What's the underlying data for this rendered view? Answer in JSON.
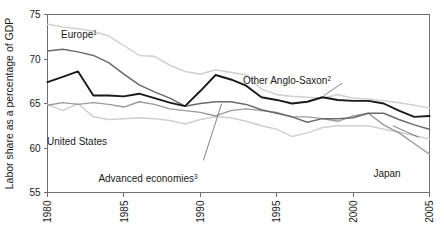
{
  "chart_data": {
    "type": "line",
    "title": "",
    "subtitle": "",
    "xlabel": "",
    "ylabel": "Labor share as a percentage of GDP",
    "xlim": [
      1980,
      2005
    ],
    "ylim": [
      55,
      75
    ],
    "xticks": [
      "1980",
      "1985",
      "1990",
      "1995",
      "2000",
      "2005"
    ],
    "xtick_values": [
      1980,
      1985,
      1990,
      1995,
      2000,
      2005
    ],
    "yticks": [
      "55",
      "60",
      "65",
      "70",
      "75"
    ],
    "ytick_values": [
      55,
      60,
      65,
      70,
      75
    ],
    "grid": false,
    "legend_position": "inline-annotations",
    "x": [
      1980,
      1981,
      1982,
      1983,
      1984,
      1985,
      1986,
      1987,
      1988,
      1989,
      1990,
      1991,
      1992,
      1993,
      1994,
      1995,
      1996,
      1997,
      1998,
      1999,
      2000,
      2001,
      2002,
      2003,
      2004,
      2005
    ],
    "series": [
      {
        "name": "Europe",
        "footnote": "1",
        "color": "#d2d2d2",
        "width": 1.6,
        "values": [
          73.9,
          73.6,
          73.4,
          73.1,
          72.6,
          71.5,
          70.4,
          70.3,
          69.3,
          68.6,
          68.3,
          68.8,
          68.5,
          68.2,
          66.6,
          66.0,
          65.8,
          65.7,
          65.6,
          66.0,
          65.6,
          65.5,
          65.3,
          65.1,
          64.8,
          64.5
        ]
      },
      {
        "name": "Advanced economies",
        "footnote": "3",
        "color": "#6a6a6a",
        "width": 1.5,
        "values": [
          70.9,
          71.1,
          70.8,
          70.4,
          69.6,
          68.3,
          67.1,
          66.3,
          65.6,
          64.7,
          65.0,
          65.2,
          65.2,
          64.9,
          64.3,
          63.9,
          63.5,
          62.9,
          63.3,
          63.3,
          63.4,
          63.9,
          63.9,
          63.2,
          62.6,
          62.1
        ]
      },
      {
        "name": "Other Anglo-Saxon",
        "footnote": "2",
        "color": "#1a1a1a",
        "width": 1.9,
        "values": [
          67.4,
          68.0,
          68.6,
          65.9,
          65.9,
          65.8,
          66.1,
          65.6,
          65.1,
          64.7,
          66.4,
          68.2,
          67.7,
          67.0,
          65.7,
          65.4,
          65.0,
          65.2,
          65.7,
          65.4,
          65.3,
          65.3,
          65.0,
          64.2,
          63.5,
          63.6
        ]
      },
      {
        "name": "United States",
        "color": "#cfcfcf",
        "width": 1.5,
        "values": [
          64.9,
          64.2,
          65.0,
          63.5,
          63.2,
          63.3,
          63.4,
          63.3,
          63.1,
          62.7,
          63.2,
          63.5,
          63.4,
          63.0,
          62.5,
          62.1,
          61.3,
          61.7,
          62.3,
          62.5,
          62.5,
          62.5,
          62.1,
          61.8,
          61.4,
          61.0
        ]
      },
      {
        "name": "Japan",
        "color": "#9a9a9a",
        "width": 1.4,
        "values": [
          64.8,
          65.1,
          64.9,
          65.1,
          64.9,
          64.6,
          65.2,
          64.9,
          64.4,
          64.2,
          64.0,
          63.6,
          64.2,
          64.4,
          64.2,
          64.0,
          63.5,
          63.5,
          63.3,
          63.0,
          63.6,
          63.9,
          62.6,
          61.7,
          60.5,
          59.3
        ]
      }
    ],
    "annotations": [
      {
        "id": "europe",
        "text": "Europe",
        "sup": "1",
        "x_px": 79,
        "y_px": 38
      },
      {
        "id": "other-anglo-saxon",
        "text": "Other Anglo-Saxon",
        "sup": "2",
        "x_px": 287,
        "y_px": 84
      },
      {
        "id": "united-states",
        "text": "United States",
        "sup": "",
        "x_px": 77,
        "y_px": 145
      },
      {
        "id": "advanced-economies",
        "text": "Advanced economies",
        "sup": "3",
        "x_px": 148,
        "y_px": 182
      },
      {
        "id": "japan",
        "text": "Japan",
        "sup": "",
        "x_px": 387,
        "y_px": 177
      }
    ]
  }
}
